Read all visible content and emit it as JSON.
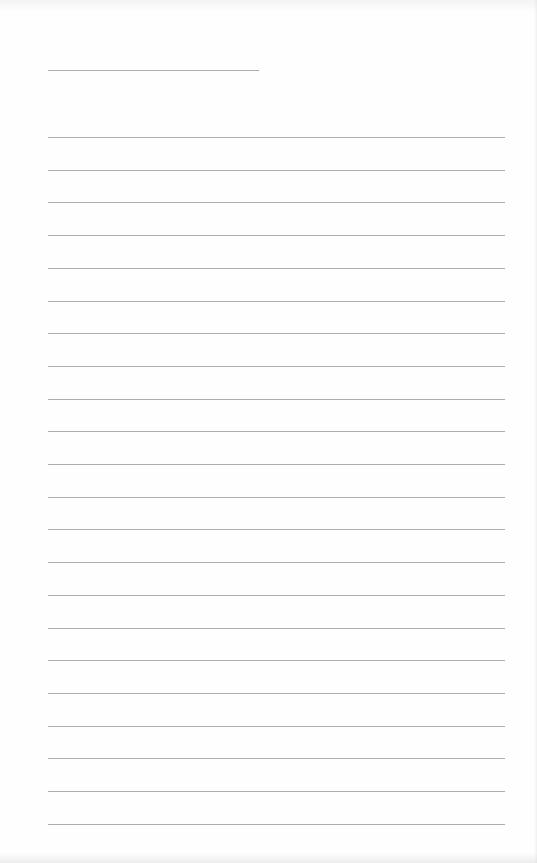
{
  "page": {
    "type": "lined-notebook-page",
    "background_color": "#fefefe",
    "rule_color": "#9e9e9e",
    "header_rule": {
      "top": 70,
      "left": 48,
      "width": 211
    },
    "rules": {
      "count": 22,
      "first_top": 137,
      "spacing": 32.7,
      "left": 48,
      "width": 457
    },
    "text": []
  }
}
